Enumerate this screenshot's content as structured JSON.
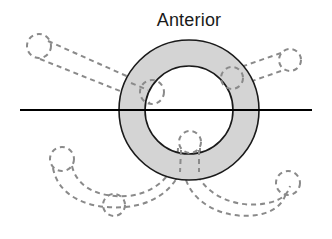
{
  "figure": {
    "title": "Anterior",
    "type": "anatomical-cross-section"
  },
  "labels": {
    "anterior": "Anterior"
  },
  "colors": {
    "background": "#ffffff",
    "annulus_fill": "#d4d4d4",
    "annulus_stroke": "#1a1a1a",
    "inner_fill": "#ffffff",
    "axis_line": "#000000",
    "dashed_stroke": "#8a8a8a",
    "text": "#1a1a1a"
  },
  "geometry": {
    "canvas": {
      "width": 332,
      "height": 239
    },
    "center": {
      "x": 189,
      "y": 110
    },
    "outer_circle": {
      "cx": 189,
      "cy": 110,
      "r": 70
    },
    "inner_circle": {
      "cx": 189,
      "cy": 110,
      "r": 44
    },
    "axis_line": {
      "x1": 20,
      "y1": 110,
      "x2": 312,
      "y2": 110,
      "stroke_width": 2
    },
    "title_position": {
      "x": 189,
      "y": 26
    }
  },
  "annotations": {
    "annulus_markers": [
      {
        "name": "marker-left",
        "cx": 152,
        "cy": 92,
        "r": 12
      },
      {
        "name": "marker-upper-right",
        "cx": 232,
        "cy": 78,
        "r": 11
      },
      {
        "name": "marker-bottom",
        "cx": 190,
        "cy": 142,
        "r": 11
      }
    ],
    "branches": [
      {
        "name": "branch-upper-left",
        "terminal_circle": {
          "cx": 39,
          "cy": 46,
          "r": 12
        },
        "dash": "5,4"
      },
      {
        "name": "branch-upper-right",
        "terminal_circle": {
          "cx": 290,
          "cy": 60,
          "r": 11
        },
        "dash": "5,4"
      },
      {
        "name": "branch-lower-left",
        "terminal_circle": {
          "cx": 62,
          "cy": 159,
          "r": 12
        },
        "mid_circle": {
          "cx": 114,
          "cy": 205,
          "r": 11
        },
        "dash": "5,4"
      },
      {
        "name": "branch-lower-right",
        "terminal_circle": {
          "cx": 288,
          "cy": 183,
          "r": 12
        },
        "dash": "5,4"
      }
    ]
  }
}
